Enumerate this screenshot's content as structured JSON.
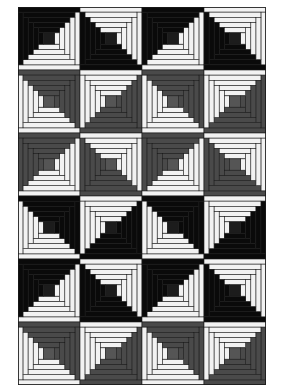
{
  "figure": {
    "columns": 4,
    "rows": 6,
    "rounds_per_block": 5,
    "colors": {
      "black": "#0a0a0a",
      "gray": "#4a4a4a",
      "light": "#f2f2f2",
      "seam": "#1a1a1a",
      "center_black": "#1c1c1c",
      "center_gray": "#555555"
    },
    "blocks": [
      [
        {
          "dark": "black",
          "light_corner": "BR"
        },
        {
          "dark": "black",
          "light_corner": "TR"
        },
        {
          "dark": "black",
          "light_corner": "BR"
        },
        {
          "dark": "black",
          "light_corner": "TR"
        }
      ],
      [
        {
          "dark": "gray",
          "light_corner": "BL"
        },
        {
          "dark": "gray",
          "light_corner": "TL"
        },
        {
          "dark": "gray",
          "light_corner": "BL"
        },
        {
          "dark": "gray",
          "light_corner": "TL"
        }
      ],
      [
        {
          "dark": "gray",
          "light_corner": "BR"
        },
        {
          "dark": "gray",
          "light_corner": "TR"
        },
        {
          "dark": "gray",
          "light_corner": "BR"
        },
        {
          "dark": "gray",
          "light_corner": "TR"
        }
      ],
      [
        {
          "dark": "black",
          "light_corner": "BL"
        },
        {
          "dark": "black",
          "light_corner": "TL"
        },
        {
          "dark": "black",
          "light_corner": "BL"
        },
        {
          "dark": "black",
          "light_corner": "TL"
        }
      ],
      [
        {
          "dark": "black",
          "light_corner": "BR"
        },
        {
          "dark": "black",
          "light_corner": "TR"
        },
        {
          "dark": "black",
          "light_corner": "BR"
        },
        {
          "dark": "black",
          "light_corner": "TR"
        }
      ],
      [
        {
          "dark": "gray",
          "light_corner": "BL"
        },
        {
          "dark": "gray",
          "light_corner": "TL"
        },
        {
          "dark": "gray",
          "light_corner": "BL"
        },
        {
          "dark": "gray",
          "light_corner": "TL"
        }
      ]
    ]
  }
}
